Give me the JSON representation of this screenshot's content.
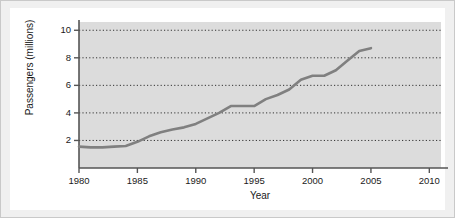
{
  "chart_data": {
    "type": "line",
    "title": "",
    "xlabel": "Year",
    "ylabel": "Passengers (millions)",
    "xlim": [
      1980,
      2011
    ],
    "ylim": [
      0,
      10.6
    ],
    "xticks": [
      1980,
      1985,
      1990,
      1995,
      2000,
      2005,
      2010
    ],
    "yticks": [
      2,
      4,
      6,
      8,
      10
    ],
    "xtick_labels": [
      "1980",
      "1985",
      "1990",
      "1995",
      "2000",
      "2005",
      "2010"
    ],
    "ytick_labels": [
      "2",
      "4",
      "6",
      "8",
      "10"
    ],
    "grid": "horizontal-dotted",
    "legend": "none",
    "series": [
      {
        "name": "Passengers",
        "color": "#808080",
        "x": [
          1980,
          1981,
          1982,
          1983,
          1984,
          1985,
          1986,
          1987,
          1988,
          1989,
          1990,
          1991,
          1992,
          1993,
          1994,
          1995,
          1996,
          1997,
          1998,
          1999,
          2000,
          2001,
          2002,
          2003,
          2004,
          2005
        ],
        "values": [
          1.55,
          1.5,
          1.5,
          1.55,
          1.6,
          1.9,
          2.3,
          2.6,
          2.8,
          2.95,
          3.2,
          3.6,
          4.0,
          4.5,
          4.5,
          4.5,
          5.0,
          5.3,
          5.7,
          6.4,
          6.7,
          6.7,
          7.1,
          7.8,
          8.5,
          8.7
        ]
      }
    ],
    "colors": {
      "line": "#808080",
      "panel_background": "#dcdcdc",
      "page_background": "#f0f0f0",
      "mat": "#ffffff",
      "axis": "#555555",
      "gridline": "#333333",
      "text": "#1a1a1a"
    }
  }
}
